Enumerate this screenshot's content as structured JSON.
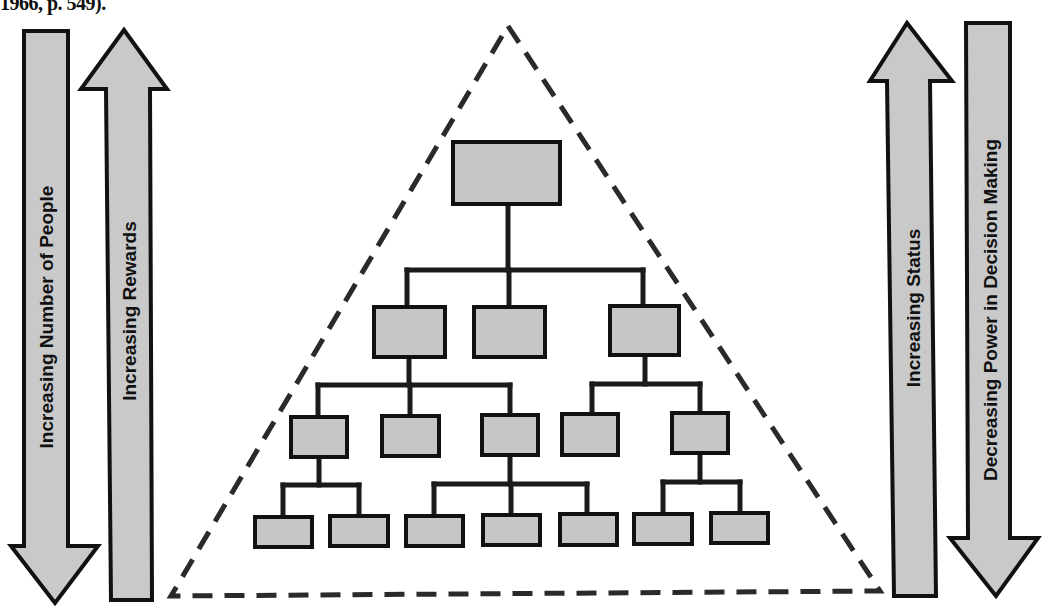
{
  "caption": {
    "text": "1966, p. 549)."
  },
  "colors": {
    "fill_gray": "#c6c6c6",
    "stroke": "#111111",
    "background": "#ffffff"
  },
  "left_arrows": [
    {
      "id": "people",
      "direction": "down",
      "label": "Increasing Number of People",
      "icon": "arrow-down-icon"
    },
    {
      "id": "rewards",
      "direction": "up",
      "label": "Increasing Rewards",
      "icon": "arrow-up-icon"
    }
  ],
  "right_arrows": [
    {
      "id": "status",
      "direction": "up",
      "label": "Increasing Status",
      "icon": "arrow-up-icon"
    },
    {
      "id": "power",
      "direction": "down",
      "label": "Decreasing Power in Decision Making",
      "icon": "arrow-down-icon"
    }
  ],
  "pyramid": {
    "shape": "dashed-triangle",
    "levels": [
      {
        "level": 1,
        "box_count": 1
      },
      {
        "level": 2,
        "box_count": 3
      },
      {
        "level": 3,
        "box_count": 5
      },
      {
        "level": 4,
        "box_count": 7
      }
    ]
  }
}
